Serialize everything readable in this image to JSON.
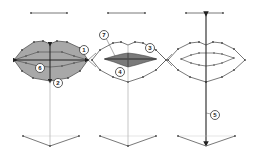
{
  "diagram": {
    "colors": {
      "line": "#555555",
      "dark_line": "#222222",
      "fill_light": "#a8a8a8",
      "fill_dark": "#7a7a7a",
      "background": "#ffffff"
    },
    "figures": [
      {
        "id": "left",
        "callouts": [
          {
            "number": "1",
            "x": 84,
            "y": 50
          },
          {
            "number": "6",
            "x": 40,
            "y": 68
          },
          {
            "number": "2",
            "x": 58,
            "y": 83
          }
        ]
      },
      {
        "id": "middle",
        "callouts": [
          {
            "number": "7",
            "x": 104,
            "y": 35
          },
          {
            "number": "3",
            "x": 150,
            "y": 48
          },
          {
            "number": "4",
            "x": 120,
            "y": 72
          }
        ]
      },
      {
        "id": "right",
        "callouts": [
          {
            "number": "5",
            "x": 215,
            "y": 115
          }
        ]
      }
    ]
  }
}
